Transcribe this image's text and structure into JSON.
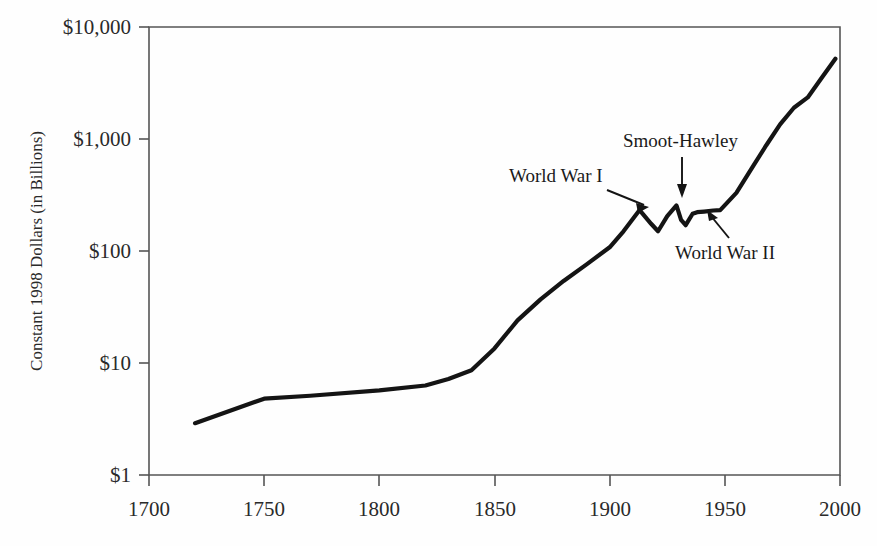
{
  "chart_data": {
    "type": "line",
    "title": "",
    "subtitle": "",
    "xlabel": "",
    "ylabel": "Constant 1998 Dollars (in Billions)",
    "grid": false,
    "legend": "none",
    "yscale": "log",
    "xscale": "linear",
    "xlim": [
      1700,
      2000
    ],
    "ylim": [
      1,
      10000
    ],
    "xticks": [
      1700,
      1750,
      1800,
      1850,
      1900,
      1950,
      2000
    ],
    "xticklabels": [
      "1700",
      "1750",
      "1800",
      "1850",
      "1900",
      "1950",
      "2000"
    ],
    "yticks": [
      1,
      10,
      100,
      1000,
      10000
    ],
    "yticklabels": [
      "$1",
      "$10",
      "$100",
      "$1,000",
      "$10,000"
    ],
    "series": [
      {
        "name": "World merchandise trade",
        "color": "#141414",
        "x": [
          1720,
          1750,
          1770,
          1800,
          1820,
          1830,
          1840,
          1850,
          1860,
          1870,
          1880,
          1890,
          1900,
          1906,
          1913,
          1918,
          1921,
          1925,
          1929,
          1931,
          1933,
          1936,
          1938,
          1941,
          1945,
          1948,
          1955,
          1962,
          1968,
          1974,
          1980,
          1986,
          1992,
          1998
        ],
        "y": [
          2.9,
          4.8,
          5.1,
          5.7,
          6.3,
          7.2,
          8.6,
          13.5,
          24.0,
          37.0,
          54.0,
          76.0,
          108.0,
          150.0,
          232.0,
          175.0,
          150.0,
          205.0,
          255.0,
          190.0,
          170.0,
          215.0,
          222.0,
          225.0,
          230.0,
          232.0,
          330.0,
          560.0,
          880.0,
          1350.0,
          1900.0,
          2350.0,
          3500.0,
          5200.0
        ]
      }
    ],
    "annotations": [
      {
        "label": "World War I",
        "x": 1913,
        "y": 232,
        "text_x": 1829,
        "text_y": 600
      },
      {
        "label": "Smoot-Hawley",
        "x": 1930,
        "y": 400,
        "text_x": 1924,
        "text_y": 1450
      },
      {
        "label": "World War II",
        "x": 1944,
        "y": 235,
        "text_x": 1955,
        "text_y": 78
      }
    ]
  },
  "axis": {
    "y_title": "Constant 1998 Dollars (in Billions)",
    "y_labels": {
      "t10000": "$10,000",
      "t1000": "$1,000",
      "t100": "$100",
      "t10": "$10",
      "t1": "$1"
    },
    "x_labels": {
      "t1700": "1700",
      "t1750": "1750",
      "t1800": "1800",
      "t1850": "1850",
      "t1900": "1900",
      "t1950": "1950",
      "t2000": "2000"
    }
  },
  "annotations": {
    "ww1": "World War I",
    "smoot": "Smoot-Hawley",
    "ww2": "World War II"
  },
  "colors": {
    "line": "#141414",
    "axis": "#555555",
    "text": "#1a1a1a",
    "background": "#fefefe"
  }
}
